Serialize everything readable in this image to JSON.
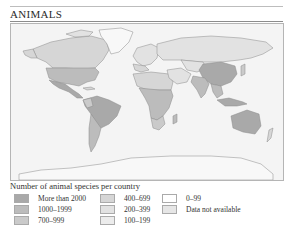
{
  "header": {
    "title": "ANIMALS"
  },
  "map": {
    "subject": "World map of animal species per country",
    "ocean_color": "#f4f4f4",
    "border_color": "#8a8a8a"
  },
  "legend": {
    "title": "Number of animal species per country",
    "items": [
      {
        "label": "More than 2000",
        "color": "#a9a9a9"
      },
      {
        "label": "1000–1999",
        "color": "#bcbcbc"
      },
      {
        "label": "700–999",
        "color": "#cacaca"
      },
      {
        "label": "400–699",
        "color": "#d6d6d6"
      },
      {
        "label": "200–399",
        "color": "#e2e2e2"
      },
      {
        "label": "100–199",
        "color": "#ececec"
      },
      {
        "label": "0–99",
        "color": "#ffffff"
      },
      {
        "label": "Data not available",
        "color": "#e6e6e6"
      }
    ]
  }
}
